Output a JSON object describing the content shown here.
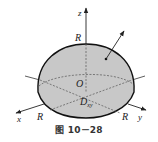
{
  "figure": {
    "caption": "图 10－28",
    "colors": {
      "surface_fill": "#c8c8c8",
      "outline": "#111111",
      "axis": "#333333",
      "dashed": "#555555",
      "background": "#ffffff"
    },
    "labels": {
      "z_axis": "z",
      "x_axis": "x",
      "y_axis": "y",
      "radius_top": "R",
      "radius_x": "R",
      "radius_y": "R",
      "origin": "O",
      "region": "D",
      "region_subscript": "xy"
    },
    "elements": {
      "surface": "upper hemisphere",
      "normal_vector": "outward normal arrow",
      "base": "projection region D_xy (disk)"
    }
  }
}
